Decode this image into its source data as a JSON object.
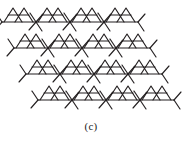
{
  "figure": {
    "caption": "(c)",
    "title": "",
    "kind": "tessellation-diagram",
    "background_color": "#ffffff",
    "line_color": "#231f20",
    "line_width": 1.15,
    "canvas": {
      "width": 182,
      "height": 143
    }
  },
  "tessellation": {
    "rows": 4,
    "columns_per_row": 4,
    "cell_width": 34,
    "cell_height": 26,
    "row_step_x": 12,
    "origin_x": 2,
    "origin_y": 4,
    "motif_name": "triangle-cluster-motif",
    "motif_paths": [
      "M 0 18 L 34 18",
      "M 2 18 L 11 4 L 20 18",
      "M 13 18 L 22 4 L 31 18",
      "M 6 11 L 27 11",
      "M 0 18 L -7 26",
      "M 0 18 L -6 9",
      "M 34 18 L 41 10",
      "M 34 18 L 40 27"
    ]
  },
  "colors": {
    "ink": "#231f20",
    "paper": "#ffffff",
    "caption_ink": "#1b1b1b"
  }
}
